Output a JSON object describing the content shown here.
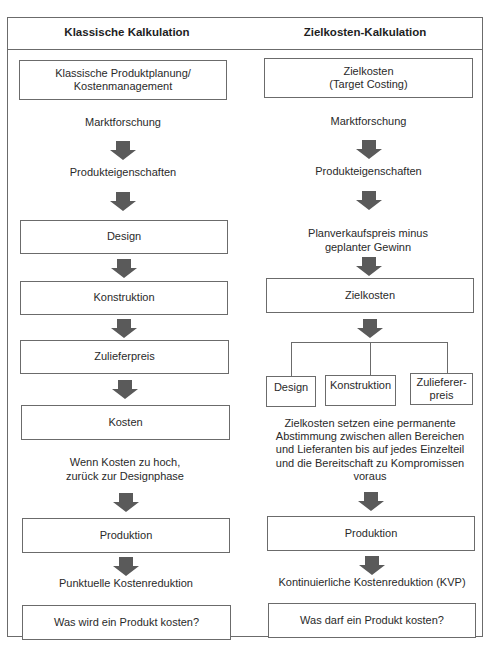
{
  "headers": {
    "left": "Klassische Kalkulation",
    "right": "Zielkosten-Kalkulation"
  },
  "left_column": {
    "start_box": "Klassische Produktplanung/ Kostenmanagement",
    "step_marktforschung": "Marktforschung",
    "step_produkteigenschaften": "Produkteigenschaften",
    "box_design": "Design",
    "box_konstruktion": "Konstruktion",
    "box_zulieferpreis": "Zulieferpreis",
    "box_kosten": "Kosten",
    "note_kosten_zu_hoch": "Wenn Kosten zu hoch, zurück zur Designphase",
    "box_produktion": "Produktion",
    "step_kostenreduktion": "Punktuelle Kostenreduktion",
    "question_box": "Was wird ein Produkt kosten?"
  },
  "right_column": {
    "start_box_line1": "Zielkosten",
    "start_box_line2": "(Target Costing)",
    "step_marktforschung": "Marktforschung",
    "step_produkteigenschaften": "Produkteigenschaften",
    "step_planverkaufspreis": "Planverkaufspreis minus geplanter Gewinn",
    "box_zielkosten": "Zielkosten",
    "branch_boxes": [
      {
        "label": "Design"
      },
      {
        "label": "Konstruktion"
      },
      {
        "label": "Zulieferer-preis"
      }
    ],
    "note_abstimmung": "Zielkosten setzen eine permanente Abstimmung zwischen allen Bereichen und Lieferanten bis auf jedes Einzelteil und die Bereitschaft zu Kompromissen voraus",
    "box_produktion": "Produktion",
    "step_kostenreduktion": "Kontinuierliche Kostenreduktion (KVP)",
    "question_box": "Was darf ein Produkt kosten?"
  },
  "colors": {
    "border": "#6b6b6b",
    "arrow": "#5a5a5a",
    "text": "#2a2a2a"
  }
}
